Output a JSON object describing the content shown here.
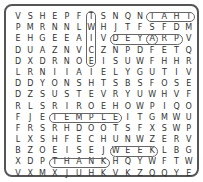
{
  "puzzle": {
    "rows": [
      [
        "V",
        "S",
        "H",
        "E",
        "P",
        "F",
        "T",
        "S",
        "N",
        "Q",
        "N",
        "T",
        "A",
        "H",
        "T"
      ],
      [
        "P",
        "M",
        "R",
        "N",
        "N",
        "L",
        "W",
        "H",
        "J",
        "T",
        "F",
        "S",
        "F",
        "D",
        "M"
      ],
      [
        "E",
        "H",
        "G",
        "E",
        "E",
        "A",
        "I",
        "V",
        "D",
        "E",
        "Y",
        "A",
        "R",
        "P",
        "V"
      ],
      [
        "D",
        "U",
        "A",
        "Z",
        "N",
        "V",
        "C",
        "Z",
        "N",
        "P",
        "D",
        "F",
        "E",
        "T",
        "Q"
      ],
      [
        "D",
        "X",
        "D",
        "R",
        "N",
        "O",
        "E",
        "I",
        "S",
        "U",
        "W",
        "F",
        "H",
        "H",
        "R"
      ],
      [
        "L",
        "R",
        "N",
        "I",
        "I",
        "A",
        "I",
        "E",
        "L",
        "Y",
        "G",
        "U",
        "T",
        "I",
        "V"
      ],
      [
        "D",
        "D",
        "Y",
        "O",
        "N",
        "S",
        "H",
        "T",
        "S",
        "B",
        "S",
        "F",
        "O",
        "S",
        "E"
      ],
      [
        "D",
        "Z",
        "S",
        "U",
        "S",
        "T",
        "E",
        "V",
        "R",
        "Y",
        "U",
        "W",
        "H",
        "V",
        "F"
      ],
      [
        "R",
        "L",
        "S",
        "R",
        "I",
        "R",
        "O",
        "E",
        "H",
        "O",
        "W",
        "P",
        "I",
        "Q",
        "O"
      ],
      [
        "F",
        "J",
        "E",
        "T",
        "E",
        "M",
        "P",
        "L",
        "E",
        "I",
        "T",
        "G",
        "M",
        "W",
        "U"
      ],
      [
        "F",
        "R",
        "S",
        "R",
        "H",
        "D",
        "O",
        "O",
        "T",
        "S",
        "F",
        "X",
        "S",
        "W",
        "P"
      ],
      [
        "L",
        "X",
        "S",
        "H",
        "F",
        "E",
        "C",
        "H",
        "U",
        "N",
        "W",
        "Z",
        "E",
        "R",
        "V"
      ],
      [
        "B",
        "Z",
        "O",
        "E",
        "I",
        "S",
        "E",
        "J",
        "W",
        "E",
        "E",
        "K",
        "L",
        "B",
        "G"
      ],
      [
        "X",
        "D",
        "P",
        "T",
        "H",
        "A",
        "N",
        "K",
        "H",
        "Q",
        "Y",
        "W",
        "F",
        "T",
        "W"
      ],
      [
        "V",
        "X",
        "M",
        "X",
        "J",
        "U",
        "H",
        "K",
        "V",
        "K",
        "Z",
        "Q",
        "Q",
        "Y",
        "E"
      ]
    ],
    "found_words": [
      {
        "word": "TAHT",
        "row": 1,
        "col": 12,
        "dir": "horizontal"
      },
      {
        "word": "DEYA",
        "row": 3,
        "col": 9,
        "dir": "horizontal"
      },
      {
        "word": "ARP",
        "row": 3,
        "col": 12,
        "dir": "horizontal"
      },
      {
        "word": "TEMPLE",
        "row": 10,
        "col": 4,
        "dir": "horizontal"
      },
      {
        "word": "THANK",
        "row": 14,
        "col": 4,
        "dir": "horizontal"
      },
      {
        "word": "WEEK",
        "row": 13,
        "col": 9,
        "dir": "horizontal"
      },
      {
        "word": "TWICE",
        "row": 1,
        "col": 7,
        "dir": "vertical"
      }
    ]
  }
}
